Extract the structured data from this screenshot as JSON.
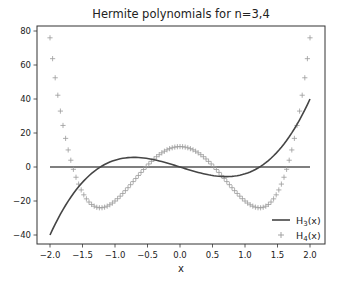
{
  "chart_data": {
    "type": "line",
    "title": "Hermite polynomials for n=3,4",
    "xlabel": "x",
    "ylabel": "",
    "xlim": [
      -2.2,
      2.2
    ],
    "ylim": [
      -45,
      83
    ],
    "xticks": [
      -2.0,
      -1.5,
      -1.0,
      -0.5,
      0.0,
      0.5,
      1.0,
      1.5,
      2.0
    ],
    "xtick_labels": [
      "−2.0",
      "−1.5",
      "−1.0",
      "−0.5",
      "0.0",
      "0.5",
      "1.0",
      "1.5",
      "2.0"
    ],
    "yticks": [
      -40,
      -20,
      0,
      20,
      40,
      60,
      80
    ],
    "ytick_labels": [
      "−40",
      "−20",
      "0",
      "20",
      "40",
      "60",
      "80"
    ],
    "grid": false,
    "legend_position": "lower right",
    "x": {
      "start": -2.0,
      "stop": 2.0,
      "num": 101
    },
    "series": [
      {
        "name": "H₃(x)",
        "formula": "8x^3 - 12x",
        "style": "line",
        "color": "#454545",
        "key_points": [
          [
            -2.0,
            -40
          ],
          [
            -0.707,
            5.66
          ],
          [
            0.0,
            0
          ],
          [
            0.707,
            -5.66
          ],
          [
            2.0,
            40
          ]
        ]
      },
      {
        "name": "H₄(x)",
        "formula": "16x^4 - 48x^2 + 12",
        "style": "plus-markers",
        "color": "#9a9a9a",
        "key_points": [
          [
            -2.0,
            76
          ],
          [
            -1.225,
            -24
          ],
          [
            0.0,
            12
          ],
          [
            1.225,
            -24
          ],
          [
            2.0,
            76
          ]
        ]
      },
      {
        "name": "zero",
        "style": "hline",
        "y": 0,
        "color": "#555555",
        "legend": false
      }
    ]
  },
  "legend": {
    "items": [
      {
        "label_main": "H",
        "label_sub": "3",
        "label_tail": "(x)"
      },
      {
        "label_main": "H",
        "label_sub": "4",
        "label_tail": "(x)"
      }
    ]
  }
}
